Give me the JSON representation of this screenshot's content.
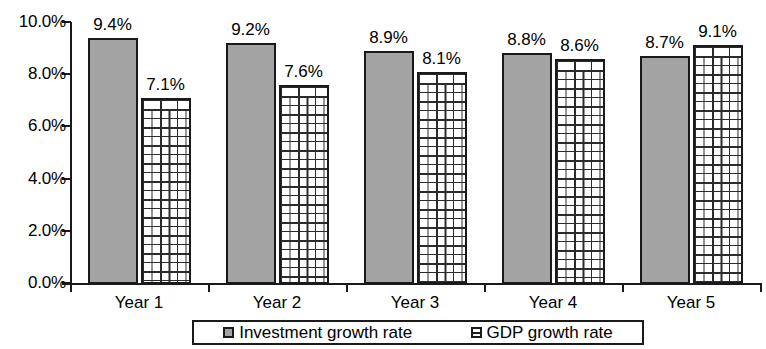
{
  "chart_data": {
    "type": "bar",
    "title": "",
    "subtitle": "",
    "xlabel": "",
    "ylabel": "",
    "categories": [
      "Year 1",
      "Year 2",
      "Year 3",
      "Year 4",
      "Year 5"
    ],
    "series": [
      {
        "name": "Investment growth rate",
        "values": [
          9.4,
          9.2,
          8.9,
          8.8,
          8.7
        ],
        "labels": [
          "9.4%",
          "9.2%",
          "8.9%",
          "8.8%",
          "8.7%"
        ],
        "fill": "#a3a3a3",
        "pattern": "solid-gray"
      },
      {
        "name": "GDP growth rate",
        "values": [
          7.1,
          7.6,
          8.1,
          8.6,
          9.1
        ],
        "labels": [
          "7.1%",
          "7.6%",
          "8.1%",
          "8.6%",
          "9.1%"
        ],
        "fill": "#ffffff",
        "pattern": "brick-hatch"
      }
    ],
    "ylim": [
      0,
      10
    ],
    "ytick_values": [
      0,
      2,
      4,
      6,
      8,
      10
    ],
    "ytick_labels": [
      "0.0%",
      "2.0%",
      "4.0%",
      "6.0%",
      "8.0%",
      "10.0%"
    ],
    "grid": false,
    "legend_position": "bottom",
    "value_labels_shown": true,
    "axis_color": "#1a1a1a"
  },
  "legend": {
    "entries": [
      {
        "label": "Investment growth rate"
      },
      {
        "label": "GDP growth rate"
      }
    ]
  }
}
